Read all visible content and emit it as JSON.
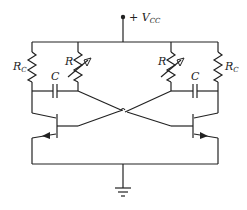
{
  "diagram": {
    "supply": {
      "label": "+ V",
      "subscript": "CC"
    },
    "components": {
      "rc_left": {
        "label": "R",
        "subscript": "C"
      },
      "rc_right": {
        "label": "R",
        "subscript": "C"
      },
      "r_var_left": {
        "label": "R"
      },
      "r_var_right": {
        "label": "R"
      },
      "cap_left": {
        "label": "C"
      },
      "cap_right": {
        "label": "C"
      }
    },
    "ground": "ground-symbol"
  }
}
